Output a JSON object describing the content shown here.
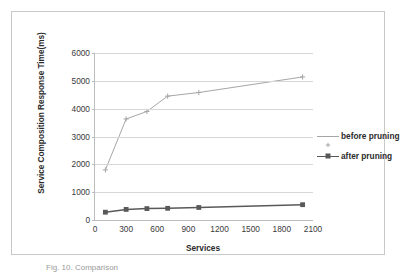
{
  "chart_data": {
    "type": "line",
    "title": "",
    "xlabel": "Services",
    "ylabel": "Service Composition Response Time(ms)",
    "x": [
      100,
      300,
      500,
      700,
      1000,
      2000
    ],
    "xlim": [
      0,
      2100
    ],
    "ylim": [
      0,
      6000
    ],
    "xticks": [
      0,
      300,
      600,
      900,
      1200,
      1500,
      1800,
      2100
    ],
    "yticks": [
      0,
      1000,
      2000,
      3000,
      4000,
      5000,
      6000
    ],
    "xtick_labels": [
      "0",
      "300",
      "600",
      "900",
      "1200",
      "1500",
      "1800",
      "2100"
    ],
    "ytick_labels": [
      "0",
      "1000",
      "2000",
      "3000",
      "4000",
      "5000",
      "6000"
    ],
    "grid": "horizontal",
    "legend_position": "right",
    "series": [
      {
        "name": "before pruning",
        "color": "#a6a6a6",
        "marker": "plus",
        "values": [
          1800,
          3630,
          3900,
          4450,
          4580,
          5140
        ]
      },
      {
        "name": "after pruning",
        "color": "#595959",
        "marker": "square",
        "values": [
          280,
          380,
          410,
          420,
          450,
          550
        ]
      }
    ]
  },
  "figure": {
    "caption": "Fig. 10.  Comparison"
  },
  "colors": {
    "frame": "#c9c9c9",
    "axis": "#bdbdbd",
    "gridline": "#d7d7d7",
    "tick_text": "#3a3a3a",
    "title_text": "#2b2b2b"
  }
}
